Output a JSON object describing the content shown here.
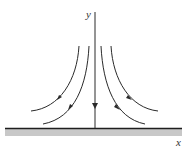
{
  "diagram": {
    "type": "stagnation-point flow toward a wall",
    "axes": {
      "x_label": "x",
      "y_label": "y"
    },
    "streamlines": {
      "count": 5,
      "direction": "downward toward wall, then outward along x"
    },
    "wall": {
      "description": "solid boundary along x-axis (shaded)"
    },
    "colors": {
      "line": "#2a2a2a",
      "wall_fill": "#c8c8c8",
      "background": "#ffffff"
    }
  }
}
